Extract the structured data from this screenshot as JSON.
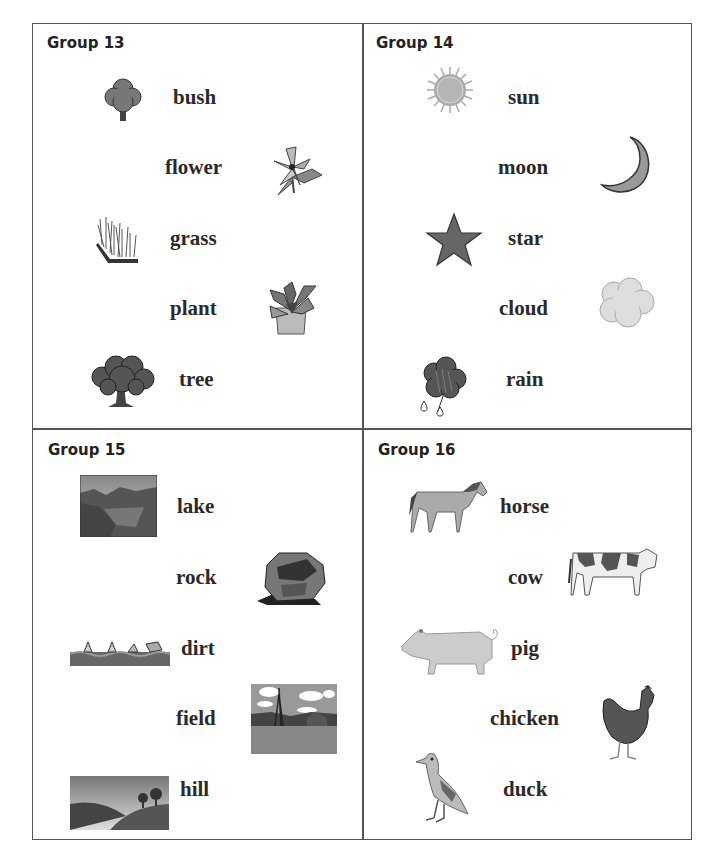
{
  "groups": [
    {
      "title": "Group 13",
      "items": [
        {
          "word": "bush",
          "icon": "bush-icon"
        },
        {
          "word": "flower",
          "icon": "flower-icon"
        },
        {
          "word": "grass",
          "icon": "grass-icon"
        },
        {
          "word": "plant",
          "icon": "potted-plant-icon"
        },
        {
          "word": "tree",
          "icon": "tree-icon"
        }
      ]
    },
    {
      "title": "Group 14",
      "items": [
        {
          "word": "sun",
          "icon": "sun-icon"
        },
        {
          "word": "moon",
          "icon": "crescent-moon-icon"
        },
        {
          "word": "star",
          "icon": "star-icon"
        },
        {
          "word": "cloud",
          "icon": "cloud-icon"
        },
        {
          "word": "rain",
          "icon": "rain-cloud-icon"
        }
      ]
    },
    {
      "title": "Group 15",
      "items": [
        {
          "word": "lake",
          "icon": "lake-photo-icon"
        },
        {
          "word": "rock",
          "icon": "rock-icon"
        },
        {
          "word": "dirt",
          "icon": "dirt-icon"
        },
        {
          "word": "field",
          "icon": "field-photo-icon"
        },
        {
          "word": "hill",
          "icon": "hill-photo-icon"
        }
      ]
    },
    {
      "title": "Group 16",
      "items": [
        {
          "word": "horse",
          "icon": "horse-icon"
        },
        {
          "word": "cow",
          "icon": "cow-icon"
        },
        {
          "word": "pig",
          "icon": "pig-icon"
        },
        {
          "word": "chicken",
          "icon": "chicken-icon"
        },
        {
          "word": "duck",
          "icon": "duck-icon"
        }
      ]
    }
  ]
}
